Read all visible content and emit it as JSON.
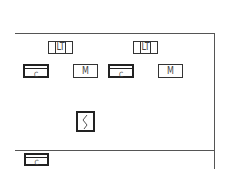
{
  "diagram": {
    "top_row_labels": [
      {
        "label": "LT"
      },
      {
        "label": "LT"
      }
    ],
    "middle_row": [
      {
        "label": "C",
        "type": "thick"
      },
      {
        "label": "M",
        "type": "thin"
      },
      {
        "label": "C",
        "type": "thick"
      },
      {
        "label": "M",
        "type": "thin"
      }
    ],
    "switch": {
      "label": "S"
    },
    "bottom": {
      "label": "C",
      "type": "thick"
    }
  }
}
